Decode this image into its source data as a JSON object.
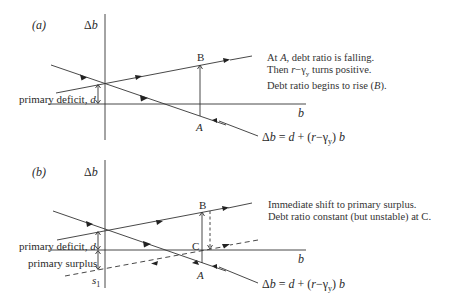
{
  "panels": [
    {
      "id": "a",
      "panel_label": "(a)",
      "y_axis_label": "Δb",
      "x_axis_label": "b",
      "point_labels": {
        "A": "A",
        "B": "B"
      },
      "intercept_label": "primary deficit, d",
      "annotation": [
        "At A, debt ratio is falling.",
        "Then r−γy turns positive.",
        "Debt ratio begins to rise (B)."
      ],
      "formula": "Δb = d + (r−γy) b"
    },
    {
      "id": "b",
      "panel_label": "(b)",
      "y_axis_label": "Δb",
      "x_axis_label": "b",
      "point_labels": {
        "A": "A",
        "B": "B",
        "C": "C",
        "s1": "s1"
      },
      "intercept_label": "primary deficit, d",
      "surplus_label": "primary surplus",
      "annotation": [
        "Immediate shift to primary surplus.",
        "Debt ratio constant (but unstable) at C."
      ],
      "formula": "Δb = d + (r−γy) b"
    }
  ],
  "text": {
    "a_label": "(a)",
    "b_label": "(b)",
    "delta_b": "Δb",
    "b": "b",
    "A": "A",
    "B": "B",
    "C": "C",
    "s": "s",
    "s_sub": "1",
    "primary_deficit": "primary deficit, ",
    "d": "d",
    "primary_surplus": "primary surplus",
    "a_ann_1_pre": "At ",
    "a_ann_1_it": "A",
    "a_ann_1_post": ", debt ratio is falling.",
    "a_ann_2_pre": "Then ",
    "a_ann_2_r": "r",
    "a_ann_2_minus": "−γ",
    "a_ann_2_sub": "y",
    "a_ann_2_post": " turns positive.",
    "a_ann_3_pre": "Debt ratio begins to rise (",
    "a_ann_3_it": "B",
    "a_ann_3_post": ").",
    "b_ann_1": "Immediate shift to primary surplus.",
    "b_ann_2": "Debt ratio constant (but unstable) at C.",
    "f_delta": "Δ",
    "f_b": "b",
    "f_eq": " = ",
    "f_d": "d",
    "f_plus": " + (",
    "f_r": "r",
    "f_minus": "−γ",
    "f_sub": "y",
    "f_close": ") ",
    "f_b2": "b"
  }
}
